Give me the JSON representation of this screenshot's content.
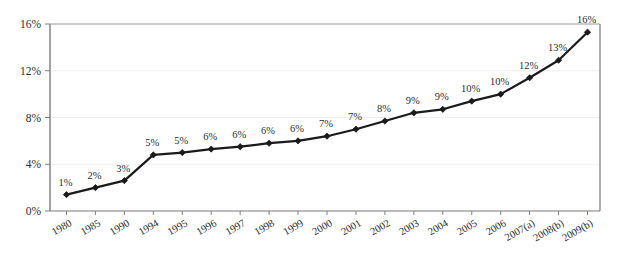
{
  "chart_data": {
    "type": "line",
    "title": "",
    "subtitle": "",
    "xlabel": "",
    "ylabel": "",
    "categories": [
      "1980",
      "1985",
      "1990",
      "1994",
      "1995",
      "1996",
      "1997",
      "1998",
      "1999",
      "2000",
      "2001",
      "2002",
      "2003",
      "2004",
      "2005",
      "2006",
      "2007(a)",
      "2008(b)",
      "2009(b)"
    ],
    "values": [
      1.4,
      2.0,
      2.6,
      4.8,
      5.0,
      5.3,
      5.5,
      5.8,
      6.0,
      6.4,
      7.0,
      7.7,
      8.4,
      8.7,
      9.4,
      10.0,
      11.4,
      12.9,
      15.3
    ],
    "point_labels": [
      "1%",
      "2%",
      "3%",
      "5%",
      "5%",
      "6%",
      "6%",
      "6%",
      "6%",
      "7%",
      "7%",
      "8%",
      "9%",
      "9%",
      "10%",
      "10%",
      "12%",
      "13%",
      "16%"
    ],
    "ylim": [
      0,
      16
    ],
    "yticks": [
      0,
      4,
      8,
      12,
      16
    ],
    "ytick_labels": [
      "0%",
      "4%",
      "8%",
      "12%",
      "16%"
    ],
    "grid": true,
    "legend": "none",
    "series_color": "#1a1a1a",
    "marker": "diamond",
    "gridline_color": "#eeeeee",
    "axis_color": "#808080"
  }
}
